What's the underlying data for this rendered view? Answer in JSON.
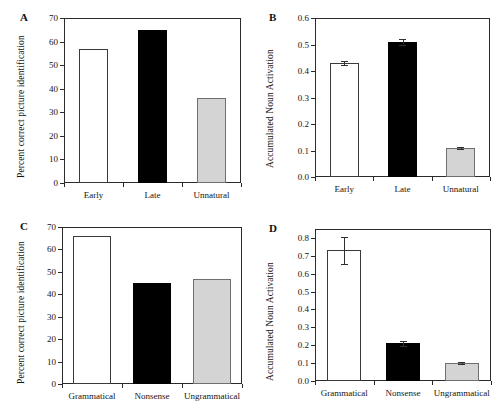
{
  "figure": {
    "background": "#ffffff",
    "bar_colors": {
      "open": "#ffffff",
      "solid": "#000000",
      "gray": "#d4d4d4",
      "outline": "#333333"
    }
  },
  "chart_data": [
    {
      "panel": "A",
      "type": "bar",
      "title": "",
      "xlabel": "",
      "ylabel": "Percent correct picture identification",
      "categories": [
        "Early",
        "Late",
        "Unnatural"
      ],
      "values": [
        57,
        65,
        36
      ],
      "errors": [
        0,
        0,
        0
      ],
      "styles": [
        "open",
        "solid",
        "gray"
      ],
      "ylim": [
        0,
        70
      ],
      "yticks": [
        0,
        10,
        20,
        30,
        40,
        50,
        60,
        70
      ],
      "ytick_labels": [
        "0",
        "10",
        "20",
        "30",
        "40",
        "50",
        "60",
        "70"
      ],
      "grid": false,
      "legend": "none"
    },
    {
      "panel": "B",
      "type": "bar",
      "title": "",
      "xlabel": "",
      "ylabel": "Accumulated Noun Activation",
      "categories": [
        "Early",
        "Late",
        "Unnatural"
      ],
      "values": [
        0.43,
        0.51,
        0.11
      ],
      "errors": [
        0.008,
        0.01,
        0.005
      ],
      "styles": [
        "open",
        "solid",
        "gray"
      ],
      "ylim": [
        0,
        0.6
      ],
      "yticks": [
        0.0,
        0.1,
        0.2,
        0.3,
        0.4,
        0.5,
        0.6
      ],
      "ytick_labels": [
        "0.0",
        "0.1",
        "0.2",
        "0.3",
        "0.4",
        "0.5",
        "0.6"
      ],
      "grid": false,
      "legend": "none"
    },
    {
      "panel": "C",
      "type": "bar",
      "title": "",
      "xlabel": "",
      "ylabel": "Percent correct picture identification",
      "categories": [
        "Grammatical",
        "Nonsense",
        "Ungrammatical"
      ],
      "values": [
        66,
        45,
        47
      ],
      "errors": [
        0,
        0,
        0
      ],
      "styles": [
        "open",
        "solid",
        "gray"
      ],
      "ylim": [
        0,
        70
      ],
      "yticks": [
        0,
        10,
        20,
        30,
        40,
        50,
        60,
        70
      ],
      "ytick_labels": [
        "0",
        "10",
        "20",
        "30",
        "40",
        "50",
        "60",
        "70"
      ],
      "grid": false,
      "legend": "none"
    },
    {
      "panel": "D",
      "type": "bar",
      "title": "",
      "xlabel": "",
      "ylabel": "Accumulated Noun Activation",
      "categories": [
        "Grammatical",
        "Nonsense",
        "Ungrammatical"
      ],
      "values": [
        0.73,
        0.21,
        0.1
      ],
      "errors": [
        0.075,
        0.014,
        0.005
      ],
      "styles": [
        "open",
        "solid",
        "gray"
      ],
      "ylim": [
        0,
        0.85
      ],
      "yticks": [
        0.0,
        0.1,
        0.2,
        0.3,
        0.4,
        0.5,
        0.6,
        0.7,
        0.8
      ],
      "ytick_labels": [
        "0.0",
        "0.1",
        "0.2",
        "0.3",
        "0.4",
        "0.5",
        "0.6",
        "0.7",
        "0.8"
      ],
      "grid": false,
      "legend": "none"
    }
  ],
  "panels": {
    "A": {
      "letter": "A"
    },
    "B": {
      "letter": "B"
    },
    "C": {
      "letter": "C"
    },
    "D": {
      "letter": "D"
    }
  }
}
